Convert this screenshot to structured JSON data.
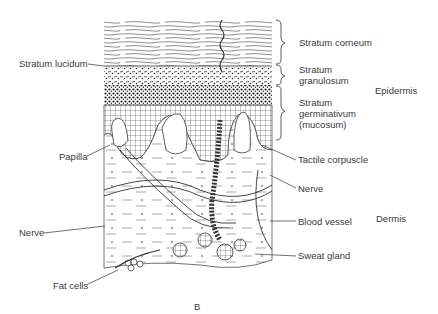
{
  "figure": {
    "panel_label": "B"
  },
  "labels": {
    "stratum_corneum": "Stratum corneum",
    "stratum_lucidum": "Stratum lucidum",
    "stratum_granulosum_1": "Stratum",
    "stratum_granulosum_2": "granulosum",
    "stratum_germinativum_1": "Stratum",
    "stratum_germinativum_2": "germinativum",
    "stratum_germinativum_3": "(mucosum)",
    "epidermis": "Epidermis",
    "dermis": "Dermis",
    "papilla": "Papilla",
    "tactile_corpuscle": "Tactile corpuscle",
    "nerve_right": "Nerve",
    "nerve_left": "Nerve",
    "blood_vessel": "Blood vessel",
    "sweat_gland": "Sweat gland",
    "fat_cells": "Fat cells"
  }
}
